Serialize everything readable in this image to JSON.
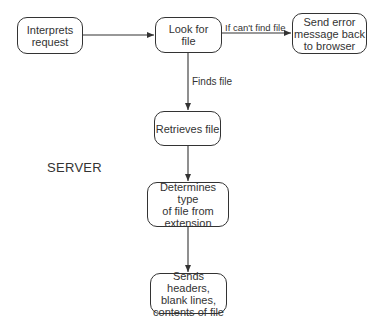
{
  "diagram": {
    "section_label": "SERVER",
    "nodes": {
      "interprets": "Interprets\nrequest",
      "look_for": "Look for\nfile",
      "send_error": "Send error\nmessage back\nto browser",
      "retrieves": "Retrieves file",
      "determines": "Determines type\nof file from\nextension",
      "sends": "Sends headers,\nblank lines,\ncontents of file"
    },
    "edges": {
      "cant_find": "If can't find file",
      "finds": "Finds file"
    },
    "colors": {
      "stroke": "#333333",
      "background": "#ffffff"
    }
  }
}
